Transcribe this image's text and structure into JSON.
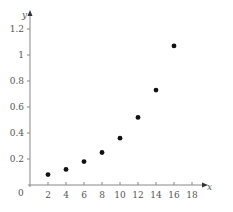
{
  "chart_data": {
    "type": "scatter",
    "title": "",
    "xlabel": "x",
    "ylabel": "y",
    "xlim": [
      0,
      19.5
    ],
    "ylim": [
      0,
      1.3
    ],
    "grid": false,
    "legend": null,
    "x_ticks": [
      2,
      4,
      6,
      8,
      10,
      12,
      14,
      16,
      18
    ],
    "y_ticks": [
      0.2,
      0.4,
      0.6,
      0.8,
      1,
      1.2
    ],
    "origin_label": "0",
    "points_x": [
      2,
      4,
      6,
      8,
      10,
      12,
      14,
      16
    ],
    "points_y": [
      0.08,
      0.12,
      0.18,
      0.25,
      0.36,
      0.52,
      0.73,
      1.07
    ],
    "marker_color": "#111111",
    "axis_color": "#888888"
  }
}
